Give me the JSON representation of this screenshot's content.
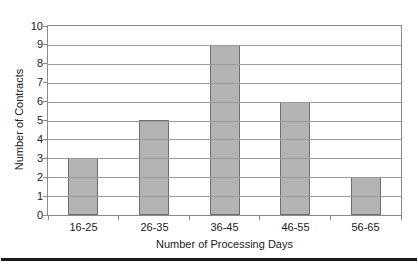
{
  "chart_data": {
    "type": "bar",
    "categories": [
      "16-25",
      "26-35",
      "36-45",
      "46-55",
      "56-65"
    ],
    "values": [
      3,
      5,
      9,
      6,
      2
    ],
    "title": "",
    "xlabel": "Number of Processing Days",
    "ylabel": "Number of Contracts",
    "ylim": [
      0,
      10
    ],
    "yticks": [
      0,
      1,
      2,
      3,
      4,
      5,
      6,
      7,
      8,
      9,
      10
    ],
    "grid": true,
    "legend_position": "none",
    "colors": {
      "bar_fill": "#b3b3b3",
      "bar_border": "#707070",
      "gridline": "#9a9a9a",
      "plot_border": "#8a8a8a",
      "text": "#222222",
      "rule": "#1b1b1b",
      "background": "#ffffff"
    }
  },
  "separator_rule": {
    "visible": true
  }
}
